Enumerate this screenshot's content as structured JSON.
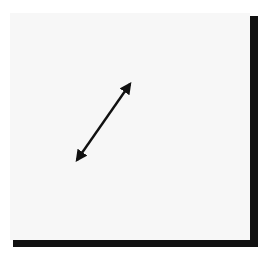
{
  "diagram": {
    "type": "triangle-relationship",
    "colors": {
      "panel_background": "#f7f7f7",
      "shadow": "#111111",
      "stroke": "#1a1a1a",
      "node_fill": "#ffffff"
    },
    "nodes": {
      "kind": {
        "label": "Kind"
      },
      "pferd": {
        "label": "Pferd"
      },
      "paedagoge": {
        "label_line1": "Päda-",
        "label_line2": "goge"
      }
    },
    "edges": {
      "thema": {
        "label": "Thema",
        "from": "Pferd",
        "to": "Kind",
        "direction": "bidirectional"
      },
      "methode": {
        "label": "Methode",
        "from": "Kind",
        "to": "Pädagoge",
        "direction": "bidirectional"
      },
      "verbindung": {
        "label": "Verbindung",
        "from": "Pferd",
        "to": "Pädagoge",
        "direction": "bidirectional"
      }
    }
  }
}
